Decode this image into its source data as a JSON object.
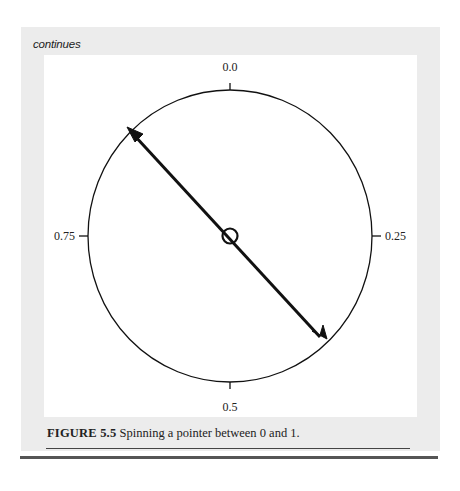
{
  "header": {
    "label": "continues"
  },
  "figure": {
    "type": "spinner-dial",
    "labels": {
      "top": "0.0",
      "right": "0.25",
      "bottom": "0.5",
      "left": "0.75"
    },
    "pointer": {
      "description": "double-headed pointer through center, pointing toward approx 0.875 and 0.375"
    },
    "colors": {
      "panel": "#ececec",
      "figure_bg": "#ffffff",
      "stroke": "#111111"
    }
  },
  "caption": {
    "number": "FIGURE 5.5",
    "text": "Spinning a pointer between 0 and 1."
  }
}
